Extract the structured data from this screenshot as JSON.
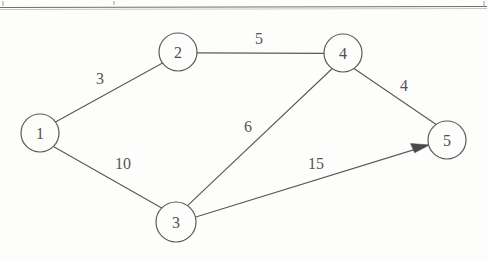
{
  "figure": {
    "type": "graph-diagram",
    "background_color": "#fdfdfb",
    "ink_color": "#5a5a5a",
    "width": 487,
    "height": 261,
    "top_rule": {
      "name": "page-rule",
      "y": 7,
      "x1": 0,
      "x2": 487,
      "color": "#6e6e6e"
    }
  },
  "graph_data": {
    "type": "weighted-graph",
    "directed_edges": 1,
    "node_radius": 19,
    "nodes": [
      {
        "id": "1",
        "label": "1",
        "x": 40,
        "y": 133,
        "r": 19
      },
      {
        "id": "2",
        "label": "2",
        "x": 178,
        "y": 52,
        "r": 19
      },
      {
        "id": "3",
        "label": "3",
        "x": 176,
        "y": 222,
        "r": 20
      },
      {
        "id": "4",
        "label": "4",
        "x": 343,
        "y": 53,
        "r": 19
      },
      {
        "id": "5",
        "label": "5",
        "x": 447,
        "y": 140,
        "r": 19
      }
    ],
    "edges": [
      {
        "id": "e12",
        "from": "1",
        "to": "2",
        "weight": "3",
        "label_x": 100,
        "label_y": 78,
        "directed": false
      },
      {
        "id": "e13",
        "from": "1",
        "to": "3",
        "weight": "10",
        "label_x": 123,
        "label_y": 163,
        "directed": false
      },
      {
        "id": "e24",
        "from": "2",
        "to": "4",
        "weight": "5",
        "label_x": 259,
        "label_y": 38,
        "directed": false
      },
      {
        "id": "e34",
        "from": "3",
        "to": "4",
        "weight": "6",
        "label_x": 248,
        "label_y": 126,
        "directed": false
      },
      {
        "id": "e45",
        "from": "4",
        "to": "5",
        "weight": "4",
        "label_x": 404,
        "label_y": 85,
        "directed": false
      },
      {
        "id": "e35",
        "from": "3",
        "to": "5",
        "weight": "15",
        "label_x": 316,
        "label_y": 163,
        "directed": true
      }
    ]
  }
}
